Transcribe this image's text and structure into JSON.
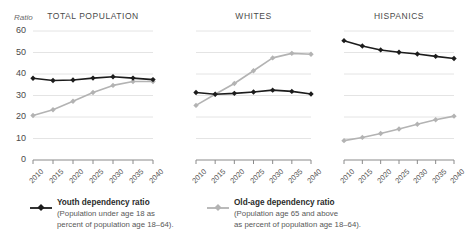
{
  "axis_unit_label": "Ratio",
  "colors": {
    "youth_series": "#1c1c1c",
    "oldage_series": "#b3b3b3",
    "gridline": "#e4e4e4",
    "axis": "#8a8a8a",
    "text": "#4a4a4a"
  },
  "legend": {
    "youth": {
      "title": "Youth dependency ratio",
      "sub_line1": "(Population under age 18 as",
      "sub_line2": "percent of population age 18–64)."
    },
    "oldage": {
      "title": "Old-age dependency ratio",
      "sub_line1": "(Population age 65 and above",
      "sub_line2": "as percent of population age 18–64)."
    }
  },
  "chart_data": {
    "type": "line",
    "title": "",
    "xlabel": "",
    "ylabel": "Ratio",
    "ylim": [
      0,
      60
    ],
    "yticks": [
      0,
      10,
      20,
      30,
      40,
      50,
      60
    ],
    "grid": true,
    "legend_position": "bottom",
    "x": [
      2010,
      2015,
      2020,
      2025,
      2030,
      2035,
      2040
    ],
    "xticklabels": [
      "2010",
      "2015",
      "2020",
      "2025",
      "2030",
      "2035",
      "2040"
    ],
    "panels": [
      {
        "title": "TOTAL POPULATION",
        "series": [
          {
            "name": "Youth dependency ratio",
            "color": "#1c1c1c",
            "values": [
              38.0,
              37.0,
              37.2,
              38.1,
              38.7,
              38.1,
              37.4
            ]
          },
          {
            "name": "Old-age dependency ratio",
            "color": "#b3b3b3",
            "values": [
              20.7,
              23.4,
              27.3,
              31.4,
              34.7,
              36.5,
              36.5
            ]
          }
        ]
      },
      {
        "title": "WHITES",
        "series": [
          {
            "name": "Youth dependency ratio",
            "color": "#1c1c1c",
            "values": [
              31.4,
              30.6,
              31.0,
              31.6,
              32.5,
              31.9,
              30.7
            ]
          },
          {
            "name": "Old-age dependency ratio",
            "color": "#b3b3b3",
            "values": [
              25.4,
              30.6,
              35.6,
              41.5,
              47.5,
              49.6,
              49.2
            ]
          }
        ]
      },
      {
        "title": "HISPANICS",
        "series": [
          {
            "name": "Youth dependency ratio",
            "color": "#1c1c1c",
            "values": [
              55.5,
              53.0,
              51.2,
              50.1,
              49.3,
              48.2,
              47.2
            ]
          },
          {
            "name": "Old-age dependency ratio",
            "color": "#b3b3b3",
            "values": [
              9.0,
              10.5,
              12.3,
              14.4,
              16.6,
              18.7,
              20.4
            ]
          }
        ]
      }
    ]
  }
}
